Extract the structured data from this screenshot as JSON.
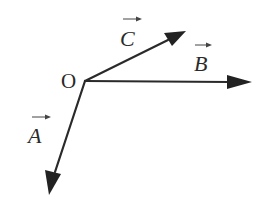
{
  "diagram": {
    "type": "vector-diagram",
    "colors": {
      "stroke": "#2a2a2a",
      "background": "#ffffff"
    },
    "origin": {
      "label": "O",
      "x": 85,
      "y": 81
    },
    "vectors": [
      {
        "id": "A",
        "label": "A",
        "has_arrow_over_label": true,
        "tip": {
          "x": 49,
          "y": 195
        },
        "direction": "down-left"
      },
      {
        "id": "B",
        "label": "B",
        "has_arrow_over_label": true,
        "tip": {
          "x": 252,
          "y": 82
        },
        "direction": "right"
      },
      {
        "id": "C",
        "label": "C",
        "has_arrow_over_label": true,
        "tip": {
          "x": 186,
          "y": 31
        },
        "direction": "up-right"
      }
    ]
  }
}
